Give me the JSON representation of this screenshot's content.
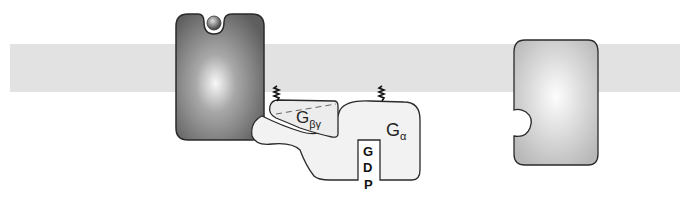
{
  "diagram": {
    "type": "G-protein coupled receptor signaling schematic",
    "colors": {
      "background": "#ffffff",
      "membrane": "#e2e2e2",
      "active_receptor_dark": "#6a6a6a",
      "active_receptor_light": "#f4f4f4",
      "inactive_receptor_dark": "#bdbdbd",
      "inactive_receptor_light": "#fafafa",
      "ligand": "#555555",
      "g_protein_fill": "#efefef",
      "outline": "#2a2a2a"
    },
    "elements": {
      "membrane": {
        "label": ""
      },
      "active_receptor": {
        "label": "",
        "has_bound_ligand": true
      },
      "ligand": {
        "label": ""
      },
      "g_beta_gamma": {
        "main": "G",
        "sub": "βγ"
      },
      "g_alpha": {
        "main": "G",
        "sub": "α"
      },
      "gdp": {
        "letters": [
          "G",
          "D",
          "P"
        ]
      },
      "inactive_receptor": {
        "label": ""
      }
    }
  }
}
